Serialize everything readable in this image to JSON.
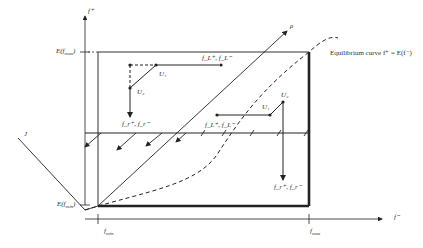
{
  "diagram": {
    "axes": {
      "y_label": "f⁺",
      "x_label": "f⁻",
      "y_ticks": [
        "E(f_max)",
        "E(f_min)"
      ],
      "x_ticks": [
        "f_min",
        "f_max"
      ]
    },
    "labels": {
      "rho": "ρ",
      "j": "J",
      "equilibrium": "Equilibrium curve f⁺ = E(f⁻)",
      "u1_top": "U₁",
      "u2_top": "U₂",
      "pair_top": "f_L⁺, f_L⁻",
      "pair_left": "f_r⁺, f_r⁻",
      "u1_right": "U₁",
      "u2_right": "U₂",
      "pair_mid": "f_L⁺, f_L⁻",
      "pair_bottom": "f_r⁺, f_r⁻"
    },
    "tick_text": {
      "E_fmax": "E(f",
      "E_fmax_sub": "max",
      "E_fmin": "E(f",
      "E_fmin_sub": "min",
      "fmin": "f",
      "fmin_sub": "min",
      "fmax": "f",
      "fmax_sub": "max"
    },
    "colors": {
      "line": "#222222",
      "box": "#333333",
      "bold_edge": "#222222"
    }
  }
}
